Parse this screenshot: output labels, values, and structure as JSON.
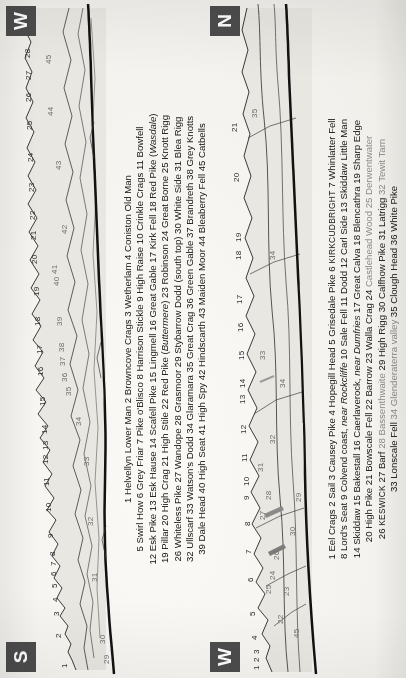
{
  "page": {
    "kind": "scanned-book-panorama-page",
    "orientation_note": "page printed sideways; text reads bottom-to-top"
  },
  "panels": [
    {
      "id": "panel-south-west",
      "badge_left": "S",
      "badge_right": "W",
      "scale_numbers": [
        "1",
        "2",
        "3",
        "4",
        "5",
        "6",
        "7",
        "8",
        "9",
        "10",
        "11",
        "12",
        "13",
        "14",
        "15",
        "16",
        "17",
        "18",
        "19",
        "20",
        "21",
        "22",
        "23",
        "24",
        "25",
        "26",
        "27",
        "28"
      ],
      "inner_numbers": [
        "29",
        "30",
        "31",
        "32",
        "33",
        "34",
        "35",
        "36",
        "37",
        "38",
        "39",
        "40",
        "41",
        "42",
        "43",
        "44",
        "45"
      ],
      "key_lines": [
        "1 Helvellyn Lower Man  2 Browncove Crags  3 Wetherlam  4 Coniston Old Man",
        "5 Swirl How  6 Grey Friar  7 Pike o'Blisco  8 Harrison Stickle  9 High Raise  10 Crinkle Crags  11 Bowfell",
        "12 Esk Pike  13 Esk Hause  14 Scafell Pike  15 Lingmell  16 Great Gable  17 Kirk Fell  18 Red Pike (Wasdale)",
        "19 Pillar  20 High Crag  21 High Stile  22 Red Pike (Buttermere)  23 Robinson  24 Great Borne  25 Knott Rigg",
        "26 Whiteless Pike  27 Wandope  28 Grasmoor  29 Stybarrow Dodd (south top)  30 White Side  31 Blea Rigg",
        "32 Ullscarf  33 Watson's Dodd  34 Glaramara  35 Great Crag  36 Green Gable  37 Brandreth  38 Grey Knotts",
        "39 Dale Head  40 High Seat  41 High Spy  42 Hindscarth  43 Maiden Moor  44 Bleaberry Fell  45 Catbells"
      ],
      "italic_terms": [
        "Wasdale",
        "Buttermere"
      ]
    },
    {
      "id": "panel-west-north",
      "badge_left": "W",
      "badge_right": "N",
      "scale_numbers": [
        "1",
        "2",
        "3",
        "4",
        "5",
        "6",
        "7",
        "8",
        "9",
        "10",
        "11",
        "12",
        "13",
        "14",
        "15",
        "16",
        "17",
        "18",
        "19",
        "20",
        "21"
      ],
      "inner_numbers": [
        "22",
        "23",
        "24",
        "25",
        "26",
        "27",
        "28",
        "29",
        "30",
        "31",
        "32",
        "33",
        "34",
        "35",
        "45"
      ],
      "key_lines": [
        "1 Eel Crags  2 Sail  3 Causey Pike  4 Hopegill Head  5 Grisedale Pike  6 KIRKCUDBRIGHT  7 Whinlatter Fell",
        "8 Lord's Seat  9 Colvend coast, near Rockcliffe  10 Sale Fell  11 Dodd  12 Carl Side  13 Skiddaw Little Man",
        "14 Skiddaw  15 Bakestall  16 Caerlaverock, near Dumfries  17 Great Calva  18 Blencathra  19 Sharp Edge",
        "20 High Pike  21 Bowscale Fell  22 Barrow  23 Walla Crag  24 Castlehead Wood  25 Derwentwater",
        "26 KESWICK  27 Barf  28 Bassenthwaite  29 High Rigg  30 Calfhow Pike  31 Latrigg  32 Tewit Tarn",
        "33 Lonscale Fell  34 Glenderaterra valley  35 Clough Head  36 White Pike"
      ],
      "italic_terms": [
        "near Rockcliffe",
        "near Dumfries"
      ],
      "smallcaps_terms": [
        "KIRKCUDBRIGHT",
        "KESWICK"
      ],
      "faded_terms": [
        "21Bowscale Fell",
        "Castlehead Wood",
        "25 Derwentwater",
        "28 Bassenthwaite",
        "32 Tewit Tarn",
        "34 Glenderaterra valley"
      ]
    }
  ],
  "colors": {
    "paper": "#f4f2ee",
    "ink": "#141414",
    "badge_bg": "#4c4c4c",
    "badge_fg": "#ffffff",
    "ridge_fill": "#e7e5df",
    "ridge_line": "#2b2b2b"
  }
}
